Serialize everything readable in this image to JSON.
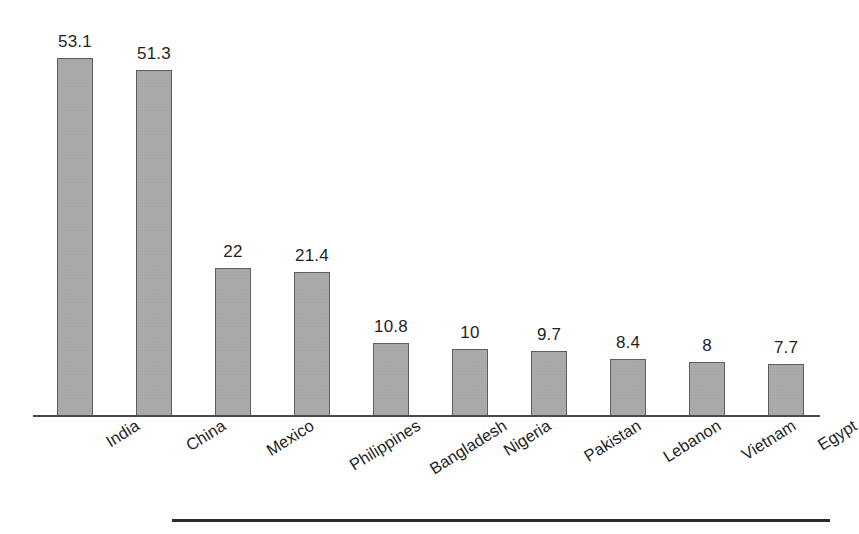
{
  "chart_data": {
    "type": "bar",
    "title": "",
    "subtitle": "",
    "xlabel": "",
    "ylabel": "",
    "categories": [
      "India",
      "China",
      "Mexico",
      "Philippines",
      "Bangladesh",
      "Nigeria",
      "Pakistan",
      "Lebanon",
      "Vietnam",
      "Egypt"
    ],
    "values": [
      53.1,
      51.3,
      22,
      21.4,
      10.8,
      10,
      9.7,
      8.4,
      8,
      7.7
    ],
    "value_labels": [
      "53.1",
      "51.3",
      "22",
      "21.4",
      "10.8",
      "10",
      "9.7",
      "8.4",
      "8",
      "7.7"
    ],
    "ylim": [
      0,
      53.1
    ],
    "grid": false,
    "legend": null,
    "axis_ticks": [],
    "bar_color": "#a9a9a9",
    "bar_border_color": "#5d5d5d",
    "axis_color": "#4a4a4a",
    "text_color": "#1f1f1f",
    "background_color": "#ffffff",
    "label_rotation_deg": -32,
    "annotations": []
  },
  "figure": {
    "rule_color": "#2b2b2b"
  }
}
